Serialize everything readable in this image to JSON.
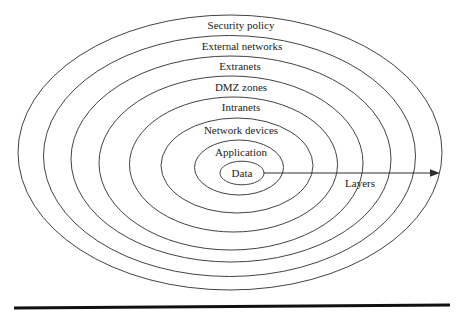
{
  "diagram": {
    "rings": [
      {
        "label": "Security policy"
      },
      {
        "label": "External networks"
      },
      {
        "label": "Extranets"
      },
      {
        "label": "DMZ zones"
      },
      {
        "label": "Intranets"
      },
      {
        "label": "Network devices"
      },
      {
        "label": "Application"
      },
      {
        "label": "Data"
      }
    ],
    "arrow_label": "Layers"
  },
  "colors": {
    "line": "#2e2e2e",
    "text": "#1b1b1b",
    "background": "#ffffff",
    "rule": "#101010"
  }
}
